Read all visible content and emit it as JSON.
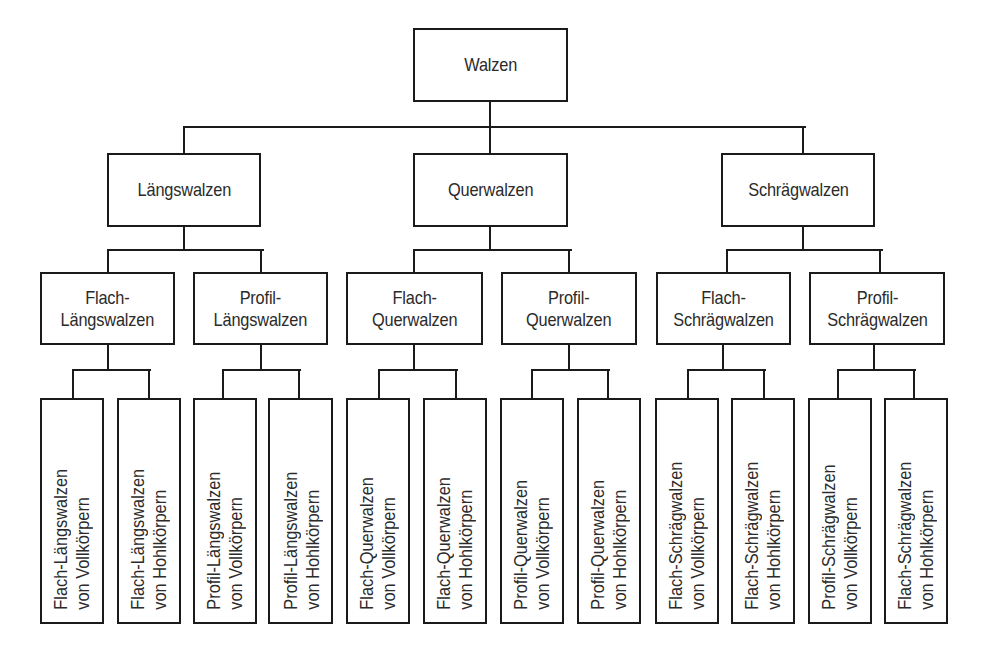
{
  "diagram": {
    "title": "Walzen",
    "root": {
      "id": "walzen",
      "lines": [
        "Walzen"
      ],
      "box": [
        413,
        28,
        155,
        74
      ]
    },
    "level2": [
      {
        "id": "laengswalzen",
        "lines": [
          "Längswalzen"
        ],
        "box": [
          107,
          153,
          154,
          74
        ]
      },
      {
        "id": "querwalzen",
        "lines": [
          "Querwalzen"
        ],
        "box": [
          413,
          153,
          155,
          74
        ]
      },
      {
        "id": "schraegwalzen",
        "lines": [
          "Schrägwalzen"
        ],
        "box": [
          721,
          153,
          154,
          74
        ]
      }
    ],
    "level3": [
      {
        "id": "flach-laengswalzen",
        "lines": [
          "Flach-",
          "Längswalzen"
        ],
        "box": [
          40,
          272,
          135,
          73
        ]
      },
      {
        "id": "profil-laengswalzen",
        "lines": [
          "Profil-",
          "Längswalzen"
        ],
        "box": [
          193,
          272,
          135,
          73
        ]
      },
      {
        "id": "flach-querwalzen",
        "lines": [
          "Flach-",
          "Querwalzen"
        ],
        "box": [
          346,
          272,
          137,
          73
        ]
      },
      {
        "id": "profil-querwalzen",
        "lines": [
          "Profil-",
          "Querwalzen"
        ],
        "box": [
          501,
          272,
          136,
          73
        ]
      },
      {
        "id": "flach-schraegwalzen",
        "lines": [
          "Flach-",
          "Schrägwalzen"
        ],
        "box": [
          656,
          272,
          135,
          73
        ]
      },
      {
        "id": "profil-schraegwalzen",
        "lines": [
          "Profil-",
          "Schrägwalzen"
        ],
        "box": [
          809,
          272,
          136,
          73
        ]
      }
    ],
    "level4": [
      {
        "id": "flach-laengswalzen-vollkoerper",
        "lines": [
          "Flach-Längswalzen",
          "von Vollkörpern"
        ],
        "box": [
          40,
          398,
          64,
          226
        ]
      },
      {
        "id": "flach-laengswalzen-hohlkoerper",
        "lines": [
          "Flach-Längswalzen",
          "von Hohlkörpern"
        ],
        "box": [
          117,
          398,
          64,
          226
        ]
      },
      {
        "id": "profil-laengswalzen-vollkoerper",
        "lines": [
          "Profil-Längswalzen",
          "von Vollkörpern"
        ],
        "box": [
          193,
          398,
          64,
          226
        ]
      },
      {
        "id": "profil-laengswalzen-hohlkoerper",
        "lines": [
          "Profil-Längswalzen",
          "von Hohlkörpern"
        ],
        "box": [
          268,
          398,
          65,
          226
        ]
      },
      {
        "id": "flach-querwalzen-vollkoerper",
        "lines": [
          "Flach-Querwalzen",
          "von Vollkörpern"
        ],
        "box": [
          346,
          398,
          64,
          226
        ]
      },
      {
        "id": "flach-querwalzen-hohlkoerper",
        "lines": [
          "Flach-Querwalzen",
          "von Hohlkörpern"
        ],
        "box": [
          423,
          398,
          64,
          226
        ]
      },
      {
        "id": "profil-querwalzen-vollkoerper",
        "lines": [
          "Profil-Querwalzen",
          "von Vollkörpern"
        ],
        "box": [
          500,
          398,
          64,
          226
        ]
      },
      {
        "id": "profil-querwalzen-hohlkoerper",
        "lines": [
          "Profil-Querwalzen",
          "von Hohlkörpern"
        ],
        "box": [
          577,
          398,
          64,
          226
        ]
      },
      {
        "id": "flach-schraegwalzen-vollkoerper",
        "lines": [
          "Flach-Schrägwalzen",
          "von Vollkörpern"
        ],
        "box": [
          655,
          398,
          64,
          226
        ]
      },
      {
        "id": "flach-schraegwalzen-hohlkoerper",
        "lines": [
          "Flach-Schrägwalzen",
          "von Hohlkörpern"
        ],
        "box": [
          731,
          398,
          64,
          226
        ]
      },
      {
        "id": "profil-schraegwalzen-vollkoerper",
        "lines": [
          "Profil-Schrägwalzen",
          "von Vollkörpern"
        ],
        "box": [
          808,
          398,
          64,
          226
        ]
      },
      {
        "id": "flach-schraegwalzen-hohlkoerper-2",
        "lines": [
          "Flach-Schrägwalzen",
          "von Hohlkörpern"
        ],
        "box": [
          884,
          398,
          64,
          226
        ]
      }
    ],
    "connectors": {
      "h": [
        [
          183,
          126,
          621
        ],
        [
          107,
          249,
          155
        ],
        [
          413,
          249,
          157
        ],
        [
          726,
          249,
          155
        ],
        [
          72,
          369,
          77
        ],
        [
          222,
          369,
          77
        ],
        [
          378,
          369,
          78
        ],
        [
          531,
          369,
          77
        ],
        [
          687,
          369,
          77
        ],
        [
          837,
          369,
          77
        ]
      ],
      "v": [
        [
          489,
          101,
          27
        ],
        [
          183,
          126,
          28
        ],
        [
          489,
          126,
          28
        ],
        [
          802,
          126,
          28
        ],
        [
          183,
          226,
          24
        ],
        [
          489,
          226,
          24
        ],
        [
          802,
          226,
          24
        ],
        [
          107,
          249,
          24
        ],
        [
          260,
          249,
          24
        ],
        [
          413,
          249,
          24
        ],
        [
          568,
          249,
          24
        ],
        [
          726,
          249,
          24
        ],
        [
          879,
          249,
          24
        ],
        [
          107,
          344,
          26
        ],
        [
          260,
          344,
          26
        ],
        [
          413,
          344,
          26
        ],
        [
          568,
          344,
          26
        ],
        [
          722,
          344,
          26
        ],
        [
          873,
          344,
          26
        ],
        [
          72,
          369,
          30
        ],
        [
          148,
          369,
          30
        ],
        [
          222,
          369,
          30
        ],
        [
          298,
          369,
          30
        ],
        [
          378,
          369,
          30
        ],
        [
          455,
          369,
          30
        ],
        [
          531,
          369,
          30
        ],
        [
          607,
          369,
          30
        ],
        [
          687,
          369,
          30
        ],
        [
          763,
          369,
          30
        ],
        [
          837,
          369,
          30
        ],
        [
          913,
          369,
          30
        ]
      ]
    },
    "colors": {
      "line": "#1a1a1a",
      "text": "#2b2b2b",
      "background": "#ffffff"
    }
  }
}
